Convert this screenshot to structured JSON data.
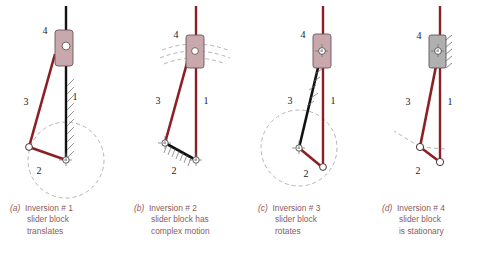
{
  "figure": {
    "colors": {
      "link_red": "#8c1f25",
      "link_black": "#111111",
      "slider_fill": "#c8a8ac",
      "slider_fill_gray": "#b0b0b0",
      "slider_stroke": "#6b5558",
      "dashed": "#a8a0a0",
      "caption_text": "#8d5b5b",
      "label_text": "#1a1a1a",
      "background": "#ffffff"
    },
    "link_labels": [
      "1",
      "2",
      "3",
      "4"
    ]
  },
  "panels": [
    {
      "id": "a",
      "caption": {
        "label": "(a)",
        "line1": "Inversion # 1",
        "line2": "slider block",
        "line3": "translates"
      },
      "labels": {
        "link1": "1",
        "link2": "2",
        "link3": "3",
        "link4": "4"
      },
      "ground_link": "1",
      "ground_link_color": "#111111",
      "slider_color": "#c8a8ac",
      "slider_orientation": "vertical",
      "notes": "slider block translates along vertical ground link"
    },
    {
      "id": "b",
      "caption": {
        "label": "(b)",
        "line1": "Inversion # 2",
        "line2": "slider block has",
        "line3": "complex motion"
      },
      "labels": {
        "link1": "1",
        "link2": "2",
        "link3": "3",
        "link4": "4"
      },
      "ground_link": "2",
      "ground_link_color": "#111111",
      "slider_color": "#c8a8ac",
      "slider_orientation": "vertical",
      "notes": "slider block has complex motion, dashed arcs shown"
    },
    {
      "id": "c",
      "caption": {
        "label": "(c)",
        "line1": "Inversion # 3",
        "line2": "slider block",
        "line3": "rotates"
      },
      "labels": {
        "link1": "1",
        "link2": "2",
        "link3": "3",
        "link4": "4"
      },
      "ground_link": "3",
      "ground_link_color": "#111111",
      "slider_color": "#c8a8ac",
      "slider_orientation": "vertical",
      "notes": "slider block rotates about fixed pivot"
    },
    {
      "id": "d",
      "caption": {
        "label": "(d)",
        "line1": "Inversion # 4",
        "line2": "slider block",
        "line3": "is stationary"
      },
      "labels": {
        "link1": "1",
        "link2": "2",
        "link3": "3",
        "link4": "4"
      },
      "ground_link": "4",
      "ground_link_color": "#b0b0b0",
      "slider_color": "#b0b0b0",
      "slider_orientation": "vertical",
      "notes": "slider block is stationary and grounded with hatching"
    }
  ]
}
